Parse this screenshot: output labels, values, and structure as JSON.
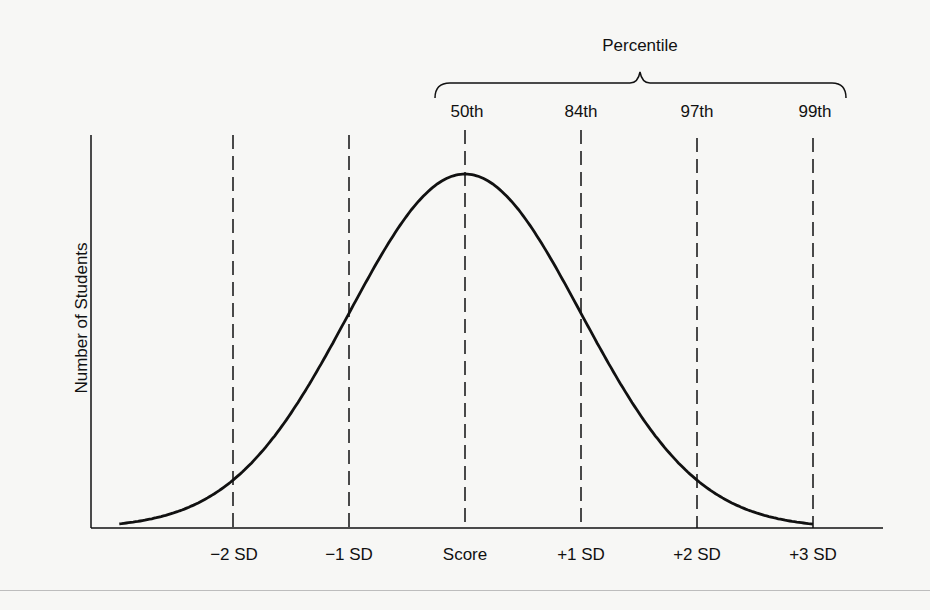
{
  "chart_data": {
    "type": "line",
    "title": "",
    "subtitle": "Normal distribution of scores with standard deviations and percentiles",
    "xlabel": "",
    "ylabel": "Number of Students",
    "x_tick_labels": [
      "−2 SD",
      "−1 SD",
      "Score",
      "+1 SD",
      "+2 SD",
      "+3 SD"
    ],
    "x_tick_values": [
      -2,
      -1,
      0,
      1,
      2,
      3
    ],
    "xlim": [
      -3,
      3.2
    ],
    "ylim": [
      0,
      1.05
    ],
    "grid": false,
    "legend": null,
    "reference_lines": [
      {
        "x": -2,
        "style": "dashed"
      },
      {
        "x": -1,
        "style": "dashed"
      },
      {
        "x": 0,
        "style": "dashed",
        "percentile": "50th"
      },
      {
        "x": 1,
        "style": "dashed",
        "percentile": "84th"
      },
      {
        "x": 2,
        "style": "dashed",
        "percentile": "97th"
      },
      {
        "x": 3,
        "style": "dashed",
        "percentile": "99th"
      }
    ],
    "annotations": {
      "bracket_label": "Percentile",
      "percentile_labels": [
        "50th",
        "84th",
        "97th",
        "99th"
      ]
    },
    "series": [
      {
        "name": "Normal curve",
        "x": [
          -3,
          -2.5,
          -2,
          -1.5,
          -1,
          -0.5,
          0,
          0.5,
          1,
          1.5,
          2,
          2.5,
          3
        ],
        "values": [
          0.011,
          0.044,
          0.135,
          0.325,
          0.607,
          0.882,
          1.0,
          0.882,
          0.607,
          0.325,
          0.135,
          0.044,
          0.011
        ]
      }
    ]
  },
  "labels": {
    "ylabel": "Number of Students",
    "bracket_title": "Percentile",
    "percentiles": [
      "50th",
      "84th",
      "97th",
      "99th"
    ],
    "xticks": [
      "−2 SD",
      "−1 SD",
      "Score",
      "+1 SD",
      "+2 SD",
      "+3 SD"
    ]
  }
}
